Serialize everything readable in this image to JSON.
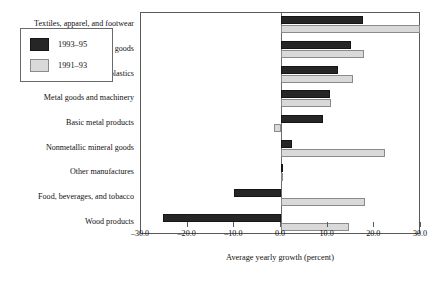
{
  "chart_data": {
    "type": "bar",
    "orientation": "horizontal",
    "title": "",
    "xlabel": "Average yearly growth (percent)",
    "ylabel": "",
    "xlim": [
      -30.0,
      30.0
    ],
    "xticks": [
      -30.0,
      -20.0,
      -10.0,
      0.0,
      10.0,
      20.0,
      30.0
    ],
    "xtick_labels": [
      "–30.0",
      "–20.0",
      "–10.0",
      "0.0",
      "10.0",
      "20.0",
      "30.0"
    ],
    "grid": false,
    "legend_position": "upper-left-inside",
    "categories": [
      "Textiles, apparel, and footwear",
      "Paper and printed goods",
      "Chemicals and plastics",
      "Metal goods and machinery",
      "Basic metal products",
      "Nonmetallic mineral goods",
      "Other manufactures",
      "Food, beverages, and tobacco",
      "Wood products"
    ],
    "series": [
      {
        "name": "1993–95",
        "color": "#262626",
        "values": [
          17.5,
          15.1,
          12.2,
          10.6,
          9.0,
          2.3,
          0.3,
          -10.0,
          -25.3
        ]
      },
      {
        "name": "1991–93",
        "color": "#d9d9d9",
        "values": [
          29.8,
          17.7,
          15.4,
          10.7,
          -1.5,
          22.2,
          0.2,
          18.0,
          14.6
        ]
      }
    ]
  },
  "axis": {
    "x_axis_title": "Average yearly growth (percent)"
  },
  "legend": {
    "entries": [
      {
        "label": "1993–95",
        "swatch": "dark"
      },
      {
        "label": "1991–93",
        "swatch": "light"
      }
    ]
  }
}
